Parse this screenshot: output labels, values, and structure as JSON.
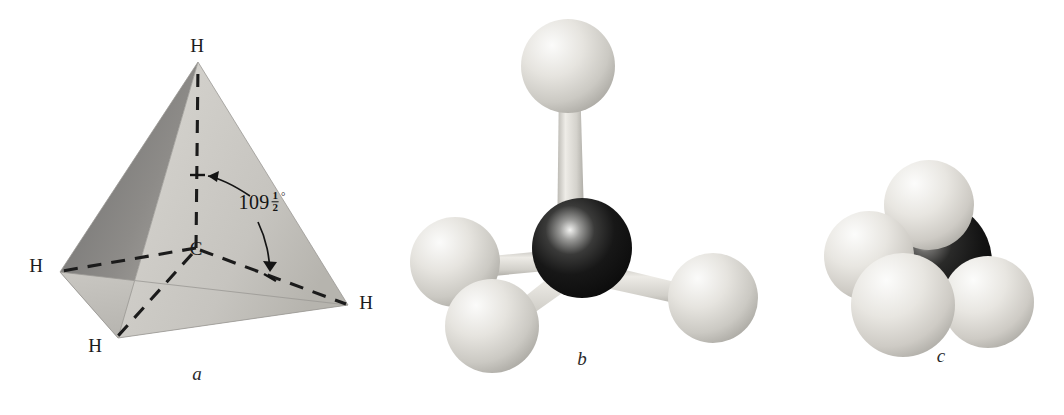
{
  "figure": {
    "background_color": "#ffffff",
    "panels": [
      {
        "id": "a",
        "letter": "a",
        "kind": "tetrahedron-geometry",
        "letter_pos": [
          197,
          374
        ],
        "atom_labels": [
          {
            "text": "H",
            "x": 197,
            "y": 45
          },
          {
            "text": "H",
            "x": 36,
            "y": 265
          },
          {
            "text": "H",
            "x": 366,
            "y": 302
          },
          {
            "text": "H",
            "x": 95,
            "y": 345
          },
          {
            "text": "C",
            "x": 196,
            "y": 248
          }
        ],
        "angle": {
          "value": "109",
          "numerator": "1",
          "denominator": "2",
          "degree_symbol": "°",
          "label_x": 262,
          "label_y": 203
        },
        "vertices": {
          "apex": [
            198,
            62
          ],
          "left": [
            60,
            272
          ],
          "right": [
            348,
            305
          ],
          "front_bottom": [
            118,
            338
          ],
          "center_c": [
            196,
            248
          ]
        },
        "face_colors": {
          "left_dark": "#767676",
          "left_mid": "#a8a6a3",
          "front_light": "#d4d2cd",
          "right_light": "#cbc9c4",
          "bottom": "#bfbdb8"
        }
      },
      {
        "id": "b",
        "letter": "b",
        "kind": "ball-and-stick",
        "letter_pos": [
          582,
          359
        ],
        "carbon": {
          "cx": 582,
          "cy": 248,
          "r": 50,
          "color": "#141414"
        },
        "hydrogens": [
          {
            "name": "h-top",
            "cx": 568,
            "cy": 66,
            "r": 47
          },
          {
            "name": "h-left",
            "cx": 455,
            "cy": 262,
            "r": 45
          },
          {
            "name": "h-front-bottom",
            "cx": 492,
            "cy": 326,
            "r": 47
          },
          {
            "name": "h-right",
            "cx": 713,
            "cy": 298,
            "r": 45
          }
        ],
        "bond_color": "#cfcdc8",
        "sphere_color": "#dedcd7"
      },
      {
        "id": "c",
        "letter": "c",
        "kind": "space-filling",
        "letter_pos": [
          941,
          356
        ],
        "carbon": {
          "cx": 930,
          "cy": 262,
          "r": 62,
          "color": "#161616"
        },
        "hydrogens": [
          {
            "name": "h-top",
            "cx": 929,
            "cy": 208,
            "r": 44
          },
          {
            "name": "h-left",
            "cx": 871,
            "cy": 258,
            "r": 44
          },
          {
            "name": "h-front",
            "cx": 904,
            "cy": 303,
            "r": 51
          },
          {
            "name": "h-right",
            "cx": 986,
            "cy": 302,
            "r": 46
          }
        ],
        "sphere_color": "#e0ded9"
      }
    ]
  }
}
